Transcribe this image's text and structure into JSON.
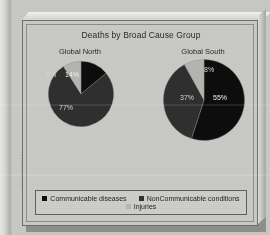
{
  "chart_data": {
    "type": "pie",
    "title": "Deaths by Broad Cause Group",
    "legend_position": "bottom",
    "legend": [
      "Communicable diseases",
      "NonCommunicable conditions",
      "Injuries"
    ],
    "colors": {
      "communicable": "#0d0d0d",
      "noncommunicable": "#2f2f2f",
      "injuries": "#b4b4b0"
    },
    "panels": [
      {
        "name": "Global North",
        "categories": [
          "Communicable diseases",
          "NonCommunicable conditions",
          "Injuries"
        ],
        "values": [
          14,
          77,
          9
        ],
        "labels": [
          "14%",
          "77%",
          "9%"
        ]
      },
      {
        "name": "Global South",
        "categories": [
          "Communicable diseases",
          "NonCommunicable conditions",
          "Injuries"
        ],
        "values": [
          55,
          37,
          8
        ],
        "labels": [
          "55%",
          "37%",
          "8%"
        ]
      }
    ]
  },
  "figure": {
    "title": "Deaths by Broad Cause Group",
    "north_label": "Global North",
    "south_label": "Global South",
    "north": {
      "communicable_pct": "14%",
      "noncommunicable_pct": "77%",
      "injuries_pct": "9%"
    },
    "south": {
      "communicable_pct": "55%",
      "noncommunicable_pct": "37%",
      "injuries_pct": "8%"
    },
    "legend": {
      "communicable": "Communicable diseases",
      "noncommunicable": "NonCommunicable conditions",
      "injuries": "Injuries"
    },
    "spine_text": "5741 0990 0004"
  }
}
